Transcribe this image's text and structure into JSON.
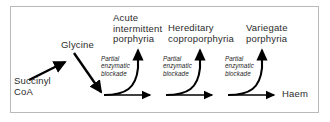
{
  "figure": {
    "border_color": "#b9b9b9",
    "background_color": "#ffffff",
    "arrow_color": "#000000",
    "text_color": "#2b2b2b"
  },
  "nodes": {
    "substrate": "Succinyl\nCoA",
    "intermediate": "Glycine",
    "product": "Haem"
  },
  "diseases": [
    {
      "label": "Acute\nintermittent\nporphyria"
    },
    {
      "label": "Hereditary\ncoproporphyria"
    },
    {
      "label": "Variegate\nporphyria"
    }
  ],
  "blockades": [
    {
      "label": "Partial\nenzymatic\nblockade"
    },
    {
      "label": "Partial\nenzymatic\nblockade"
    },
    {
      "label": "Partial\nenzymatic\nblockade"
    }
  ]
}
